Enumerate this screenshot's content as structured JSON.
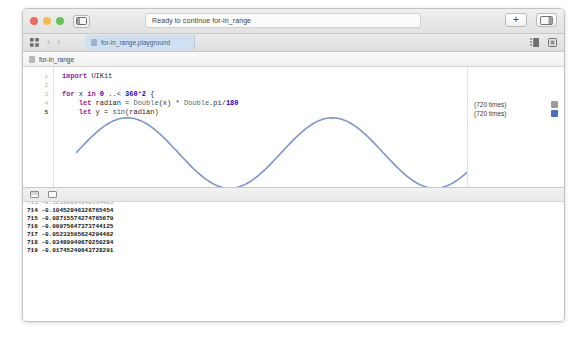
{
  "window": {
    "title_status": "Ready to continue for-in_range",
    "traffic_lights": [
      "close-red",
      "minimize-yellow",
      "zoom-green"
    ],
    "sidebar_toggle_icon": "sidebar-toggle-icon",
    "add_button_label": "+",
    "assistant_panel_icon": "editor-panel-icon",
    "colors": {
      "accent_blue": "#4a6fc4",
      "wave": "#7d95cf",
      "tab_active": "#cfe0f5",
      "chrome": "#e9e8e8"
    }
  },
  "tabbar": {
    "grid_icon": "grid-view-icon",
    "back_arrow": "‹",
    "forward_arrow": "›",
    "tab_label": "for-in_range.playground",
    "right_icons": [
      "list-view-icon",
      "assistant-editor-icon"
    ]
  },
  "breadcrumb": {
    "icon": "playground-file-icon",
    "label": "for-in_range"
  },
  "editor": {
    "lines": [
      {
        "number": "1",
        "active": false,
        "tokens": [
          {
            "t": "import ",
            "c": "kw"
          },
          {
            "t": "UIKit",
            "c": "pln"
          }
        ]
      },
      {
        "number": "2",
        "active": false,
        "tokens": []
      },
      {
        "number": "3",
        "active": false,
        "tokens": [
          {
            "t": "for",
            "c": "kw"
          },
          {
            "t": " x ",
            "c": "pln"
          },
          {
            "t": "in",
            "c": "kw"
          },
          {
            "t": " ",
            "c": "pln"
          },
          {
            "t": "0",
            "c": "num"
          },
          {
            "t": " ..< ",
            "c": "pln"
          },
          {
            "t": "360",
            "c": "num"
          },
          {
            "t": "*",
            "c": "pln"
          },
          {
            "t": "2",
            "c": "num"
          },
          {
            "t": " {",
            "c": "pln"
          }
        ]
      },
      {
        "number": "4",
        "active": false,
        "tokens": [
          {
            "t": "    ",
            "c": "pln"
          },
          {
            "t": "let",
            "c": "kw"
          },
          {
            "t": " radian = ",
            "c": "pln"
          },
          {
            "t": "Double",
            "c": "typ"
          },
          {
            "t": "(x) * ",
            "c": "pln"
          },
          {
            "t": "Double",
            "c": "typ"
          },
          {
            "t": ".pi/",
            "c": "pln"
          },
          {
            "t": "180",
            "c": "num"
          }
        ]
      },
      {
        "number": "5",
        "active": true,
        "tokens": [
          {
            "t": "    ",
            "c": "pln"
          },
          {
            "t": "let",
            "c": "kw"
          },
          {
            "t": " y = ",
            "c": "pln"
          },
          {
            "t": "sin",
            "c": "fn"
          },
          {
            "t": "(radian)",
            "c": "pln"
          }
        ]
      },
      {
        "number": "6",
        "active": false,
        "tokens": [
          {
            "t": "    ",
            "c": "pln"
          },
          {
            "t": "print",
            "c": "fn"
          },
          {
            "t": "(x, y)",
            "c": "pln"
          }
        ]
      },
      {
        "number": "7",
        "active": false,
        "tokens": [
          {
            "t": "}",
            "c": "pln"
          }
        ]
      }
    ],
    "execute_button": "execute-playground-button"
  },
  "results": [
    {
      "line": "4",
      "label": "(720 times)",
      "chip": "chip-grey"
    },
    {
      "line": "5",
      "label": "(720 times)",
      "chip": "chip-blue"
    },
    {
      "line": "6",
      "label": "(720 times)",
      "chip": "chip-grey"
    }
  ],
  "console": {
    "toolbar_icons": [
      "console-pane-icon",
      "variables-pane-icon"
    ],
    "lines": [
      {
        "index": "713",
        "value": "-0.12186934340514423",
        "clipped": true
      },
      {
        "index": "714",
        "value": "-0.10452846326765454",
        "clipped": false
      },
      {
        "index": "715",
        "value": "-0.08715574274765679",
        "clipped": false
      },
      {
        "index": "716",
        "value": "-0.06975647373744125",
        "clipped": false
      },
      {
        "index": "717",
        "value": "-0.05233595624294462",
        "clipped": false
      },
      {
        "index": "718",
        "value": "-0.03489949670250284",
        "clipped": false
      },
      {
        "index": "719",
        "value": "-0.01745240643728291",
        "clipped": false
      }
    ]
  },
  "chart_data": {
    "type": "line",
    "title": "",
    "xlabel": "x (degrees)",
    "ylabel": "sin(radian)",
    "x": [
      0,
      720
    ],
    "xlim": [
      0,
      720
    ],
    "ylim": [
      -1,
      1
    ],
    "grid": false,
    "legend": "none",
    "series": [
      {
        "name": "y = sin(radian)",
        "color": "#7d95cf",
        "n_points": 720,
        "periods": 2,
        "amplitude": 1,
        "description": "Two full sine periods over x in 0..<720 degrees"
      }
    ]
  }
}
